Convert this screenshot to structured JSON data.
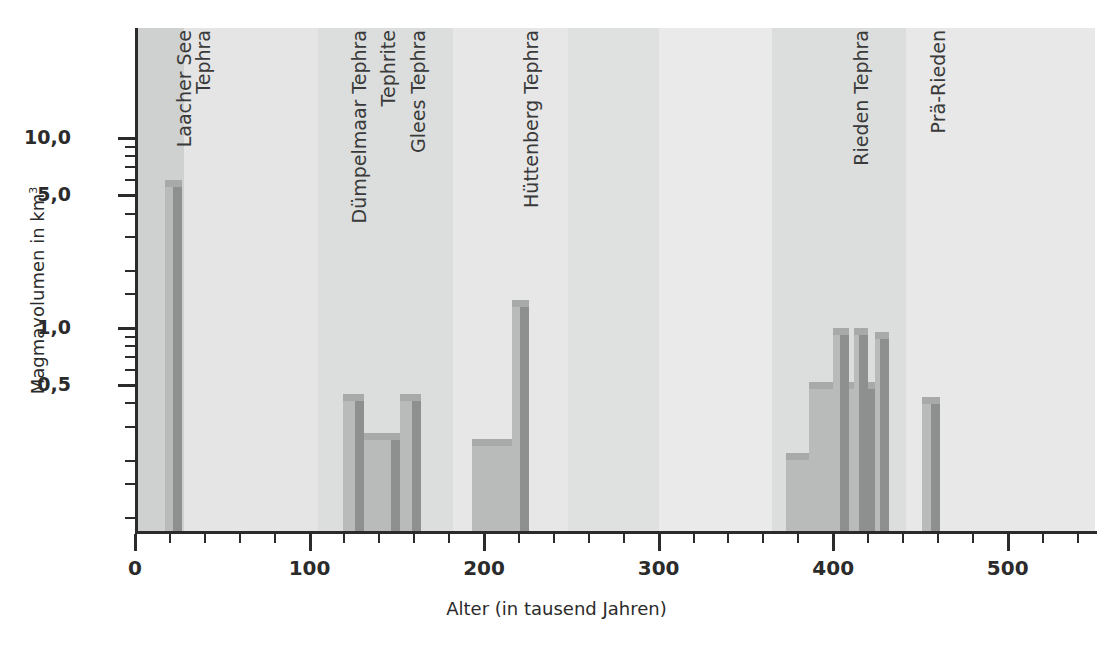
{
  "chart_data": {
    "type": "bar",
    "title": "",
    "xlabel": "Alter (in tausend Jahren)",
    "ylabel": "Magmavolumen in km",
    "ylabel_sup": "3",
    "yscale": "log",
    "xlim": [
      0,
      550
    ],
    "ylim": [
      0.06,
      20
    ],
    "grid": false,
    "legend": "none",
    "x_ticks_major": [
      0,
      100,
      200,
      300,
      400,
      500
    ],
    "x_tick_labels": [
      "0",
      "100",
      "200",
      "300",
      "400",
      "500"
    ],
    "x_tick_minor_step": 20,
    "y_ticks_major": [
      10.0,
      5.0,
      1.0,
      0.5
    ],
    "y_tick_labels": [
      "10,0",
      "5,0",
      "1,0",
      "0,5"
    ],
    "y_ticks_minor": [
      9,
      8,
      7,
      6,
      4,
      3,
      2,
      1.5,
      0.9,
      0.8,
      0.7,
      0.6,
      0.4,
      0.3,
      0.2,
      0.15,
      0.1,
      0.08
    ],
    "values": [
      {
        "name": "unnamed-early",
        "x_start": 2,
        "x_end": 12,
        "value": 0.085
      },
      {
        "name": "Laacher See Tephra",
        "x_start": 17,
        "x_end": 27,
        "value": 6.0
      },
      {
        "name": "Dümpelmaar Tephra",
        "x_start": 119,
        "x_end": 131,
        "value": 0.45
      },
      {
        "name": "Tephrite",
        "x_start": 131,
        "x_end": 152,
        "value": 0.28
      },
      {
        "name": "Glees Tephra",
        "x_start": 152,
        "x_end": 164,
        "value": 0.45
      },
      {
        "name": "Hüttenberg base",
        "x_start": 193,
        "x_end": 222,
        "value": 0.26
      },
      {
        "name": "Hüttenberg Tephra",
        "x_start": 216,
        "x_end": 226,
        "value": 1.4
      },
      {
        "name": "Rieden base wide",
        "x_start": 373,
        "x_end": 412,
        "value": 0.22
      },
      {
        "name": "Rieden mid",
        "x_start": 386,
        "x_end": 425,
        "value": 0.52
      },
      {
        "name": "Rieden peak 1",
        "x_start": 400,
        "x_end": 409,
        "value": 1.0
      },
      {
        "name": "Rieden peak 2",
        "x_start": 412,
        "x_end": 420,
        "value": 1.0
      },
      {
        "name": "Rieden peak 3",
        "x_start": 424,
        "x_end": 432,
        "value": 0.95
      },
      {
        "name": "Prä-Rieden",
        "x_start": 451,
        "x_end": 461,
        "value": 0.43
      }
    ],
    "annotations": [
      {
        "label": "Laacher See",
        "x": 23,
        "line": 1
      },
      {
        "label": "Tephra",
        "x": 34,
        "line": 2
      },
      {
        "label": "Dümpelmaar Tephra",
        "x": 123,
        "line": 1
      },
      {
        "label": "Tephrite",
        "x": 140,
        "line": 1
      },
      {
        "label": "Glees Tephra",
        "x": 157,
        "line": 1
      },
      {
        "label": "Hüttenberg Tephra",
        "x": 222,
        "line": 1
      },
      {
        "label": "Rieden Tephra",
        "x": 411,
        "line": 1
      },
      {
        "label": "Prä-Rieden",
        "x": 455,
        "line": 1
      }
    ],
    "background_bands": [
      {
        "x_start": 0,
        "x_end": 28,
        "color": "#cfd1d0"
      },
      {
        "x_start": 28,
        "x_end": 105,
        "color": "#e4e5e4"
      },
      {
        "x_start": 105,
        "x_end": 182,
        "color": "#dcdedd"
      },
      {
        "x_start": 182,
        "x_end": 248,
        "color": "#e6e7e6"
      },
      {
        "x_start": 248,
        "x_end": 300,
        "color": "#dfe1e0"
      },
      {
        "x_start": 300,
        "x_end": 365,
        "color": "#e9eae9"
      },
      {
        "x_start": 365,
        "x_end": 442,
        "color": "#dcdedd"
      },
      {
        "x_start": 442,
        "x_end": 550,
        "color": "#e7e8e7"
      }
    ],
    "colors": {
      "bar_front": "#b9bbba",
      "bar_side": "#8d908f",
      "bar_top": "#a7aaa9",
      "axis": "#2b2b2b",
      "text": "#2b2b2b"
    }
  }
}
